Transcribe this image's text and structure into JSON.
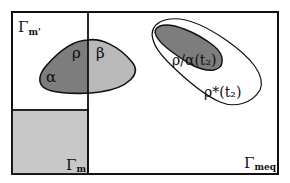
{
  "diagram": {
    "type": "set-region diagram",
    "colors": {
      "background": "#ffffff",
      "stroke": "#111111",
      "gamma_m_fill": "#c8c8c8",
      "rho_alpha_fill": "#7d7d7d",
      "beta_fill": "#b9b9b9",
      "rho_alpha_t2_fill": "#7d7d7d",
      "rho_star_t2_fill": "#ffffff"
    },
    "regions": {
      "gamma_meq": {
        "label": "Γ",
        "subscript": "meq"
      },
      "gamma_m_prime": {
        "label": "Γ",
        "subscript": "m'"
      },
      "gamma_m": {
        "label": "Γ",
        "subscript": "m"
      },
      "alpha": {
        "label": "α"
      },
      "rho": {
        "label": "ρ"
      },
      "beta": {
        "label": "β"
      },
      "rho_alpha_t2": {
        "label": "ρ/α(t₂)"
      },
      "rho_star_t2": {
        "label": "ρ*(t₂)"
      }
    }
  }
}
